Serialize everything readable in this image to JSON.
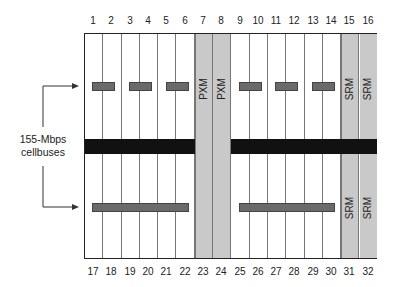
{
  "diagram": {
    "top_slot_numbers": [
      "1",
      "2",
      "3",
      "4",
      "5",
      "6",
      "7",
      "8",
      "9",
      "10",
      "11",
      "12",
      "13",
      "14",
      "15",
      "16"
    ],
    "bottom_slot_numbers": [
      "17",
      "18",
      "19",
      "20",
      "21",
      "22",
      "23",
      "24",
      "25",
      "26",
      "27",
      "28",
      "29",
      "30",
      "31",
      "32"
    ],
    "modules": {
      "pxm_top_a": "PXM",
      "pxm_top_b": "PXM",
      "srm_top_a": "SRM",
      "srm_top_b": "SRM",
      "srm_bottom_a": "SRM",
      "srm_bottom_b": "SRM"
    },
    "callout_label_line1": "155-Mbps",
    "callout_label_line2": "cellbuses",
    "colors": {
      "frame": "#222222",
      "reserved_slot": "#c9c9c9",
      "cellbus": "#111111",
      "connector_bar": "#6a6a6a"
    }
  }
}
